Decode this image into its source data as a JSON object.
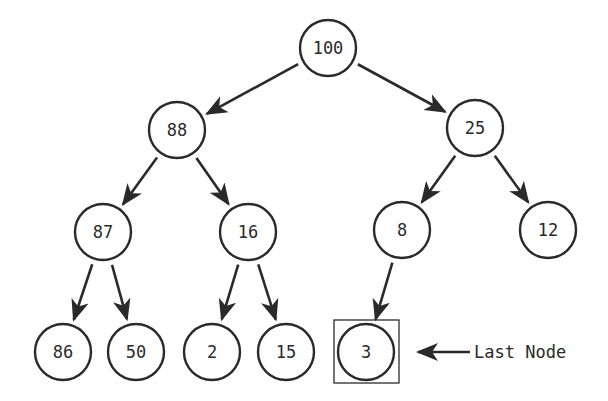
{
  "diagram": {
    "type": "binary-heap-tree",
    "colors": {
      "stroke": "#2a2a2a",
      "background": "#ffffff"
    },
    "node_radius": 28,
    "nodes": [
      {
        "id": "n100",
        "value": "100",
        "x": 328,
        "y": 48
      },
      {
        "id": "n88",
        "value": "88",
        "x": 177,
        "y": 130
      },
      {
        "id": "n25",
        "value": "25",
        "x": 475,
        "y": 128
      },
      {
        "id": "n87",
        "value": "87",
        "x": 103,
        "y": 232
      },
      {
        "id": "n16",
        "value": "16",
        "x": 248,
        "y": 232
      },
      {
        "id": "n8",
        "value": "8",
        "x": 402,
        "y": 230
      },
      {
        "id": "n12",
        "value": "12",
        "x": 548,
        "y": 230
      },
      {
        "id": "n86",
        "value": "86",
        "x": 63,
        "y": 352
      },
      {
        "id": "n50",
        "value": "50",
        "x": 136,
        "y": 352
      },
      {
        "id": "n2",
        "value": "2",
        "x": 212,
        "y": 352
      },
      {
        "id": "n15",
        "value": "15",
        "x": 286,
        "y": 352
      },
      {
        "id": "n3",
        "value": "3",
        "x": 366,
        "y": 352
      }
    ],
    "edges": [
      {
        "from": "n100",
        "to": "n88"
      },
      {
        "from": "n100",
        "to": "n25"
      },
      {
        "from": "n88",
        "to": "n87"
      },
      {
        "from": "n88",
        "to": "n16"
      },
      {
        "from": "n25",
        "to": "n8"
      },
      {
        "from": "n25",
        "to": "n12"
      },
      {
        "from": "n87",
        "to": "n86"
      },
      {
        "from": "n87",
        "to": "n50"
      },
      {
        "from": "n16",
        "to": "n2"
      },
      {
        "from": "n16",
        "to": "n15"
      },
      {
        "from": "n8",
        "to": "n3"
      }
    ],
    "highlight": {
      "node": "n3",
      "box": {
        "x": 334,
        "y": 320,
        "w": 65,
        "h": 63
      }
    },
    "annotation": {
      "label": "Last Node",
      "arrow_from_x": 470,
      "arrow_to_x": 418,
      "y": 352,
      "text_x": 474
    }
  }
}
